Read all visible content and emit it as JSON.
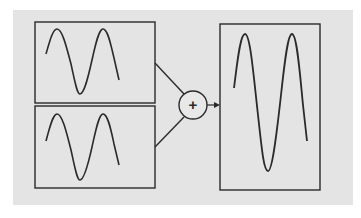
{
  "diagram": {
    "colors": {
      "background": "#ffffff",
      "panel": "#e4e4e4",
      "stroke": "#2a2a2a"
    },
    "inputs": [
      {
        "id": "wave-a",
        "label": "Input wave A",
        "cycles": 1.75,
        "amplitude": "small"
      },
      {
        "id": "wave-b",
        "label": "Input wave B",
        "cycles": 1.75,
        "amplitude": "small"
      }
    ],
    "operator": {
      "symbol": "+",
      "label": "Sum"
    },
    "output": {
      "id": "wave-sum",
      "label": "Resulting wave",
      "cycles": 1.75,
      "amplitude": "large"
    }
  }
}
